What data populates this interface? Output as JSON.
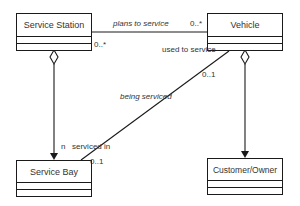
{
  "diagram": {
    "type": "UML class diagram",
    "classes": [
      {
        "id": "service-station",
        "name": "Service Station"
      },
      {
        "id": "vehicle",
        "name": "Vehicle"
      },
      {
        "id": "service-bay",
        "name": "Service Bay"
      },
      {
        "id": "customer-owner",
        "name": "Customer/Owner"
      }
    ],
    "associations": [
      {
        "from": "Service Station",
        "to": "Vehicle",
        "label": "plans to service",
        "multiplicity_from": "0..*",
        "multiplicity_to": "0..*"
      },
      {
        "from": "Vehicle",
        "to": "Service Bay",
        "label": "being serviced",
        "role_at_vehicle": "used to service",
        "role_at_bay": "serviced in",
        "multiplicity_at_vehicle": "0..1",
        "multiplicity_at_bay": "0..1"
      },
      {
        "from": "Service Station",
        "to": "Service Bay",
        "kind": "aggregation",
        "multiplicity_at_bay": "n"
      },
      {
        "from": "Vehicle",
        "to": "Customer/Owner",
        "kind": "aggregation"
      }
    ],
    "labels": {
      "plans_to_service": "plans to service",
      "mult_station_right": "0..*",
      "mult_vehicle_left": "0..*",
      "used_to_service": "used to service",
      "mult_vehicle_bottom": "0..1",
      "being_serviced": "being serviced",
      "mult_n": "n",
      "serviced_in": "serviced in",
      "mult_bay": "0..1"
    },
    "colors": {
      "line": "#1a1a1a",
      "text": "#333333",
      "background": "#ffffff"
    }
  }
}
